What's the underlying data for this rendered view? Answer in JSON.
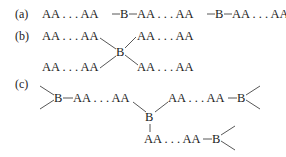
{
  "panels": {
    "a": {
      "label": "(a)",
      "seg1": "AA . . . AA",
      "b1": "B",
      "seg2": "AA . . . AA",
      "b2": "B",
      "seg3": "AA . . . AA"
    },
    "b": {
      "label": "(b)",
      "upper_left": "AA . . . AA",
      "upper_right": "AA . . . AA",
      "center": "B",
      "lower_left": "AA . . . AA",
      "lower_right": "AA . . . AA"
    },
    "c": {
      "label": "(c)",
      "left_b": "B",
      "left_chain": "AA . . . AA",
      "center_b": "B",
      "right_chain": "AA . . . AA",
      "right_b": "B",
      "lower_chain": "AA . . . AA",
      "lower_b": "B"
    }
  },
  "colors": {
    "text": "#222222",
    "bond": "#444444",
    "background": "#ffffff"
  }
}
